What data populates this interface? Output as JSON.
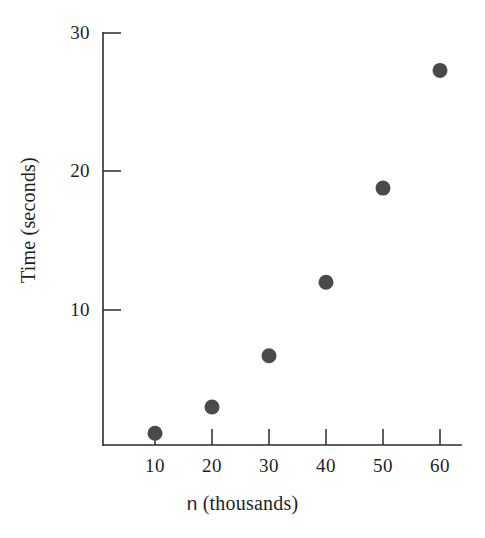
{
  "chart_data": {
    "type": "scatter",
    "title": "",
    "xlabel": "n (thousands)",
    "xlabel_variable": "n",
    "xlabel_rest": " (thousands)",
    "ylabel": "Time (seconds)",
    "x": [
      10,
      20,
      30,
      40,
      50,
      60
    ],
    "values": [
      1.1,
      3.0,
      6.7,
      12.0,
      18.8,
      27.3
    ],
    "points": [
      {
        "x": 10,
        "y": 1.1
      },
      {
        "x": 20,
        "y": 3.0
      },
      {
        "x": 30,
        "y": 6.7
      },
      {
        "x": 40,
        "y": 12.0
      },
      {
        "x": 50,
        "y": 18.8
      },
      {
        "x": 60,
        "y": 27.3
      }
    ],
    "xlim": [
      5,
      64
    ],
    "ylim": [
      0,
      30
    ],
    "xticks": [
      10,
      20,
      30,
      40,
      50,
      60
    ],
    "xtick_labels": [
      "10",
      "20",
      "30",
      "40",
      "50",
      "60"
    ],
    "yticks": [
      10,
      20,
      30
    ],
    "ytick_labels": [
      "10",
      "20",
      "30"
    ],
    "grid": false,
    "legend": false,
    "marker_color": "#4a4a4a",
    "marker_shape": "circle",
    "axis_color": "#2b2b2b",
    "background_color": "#ffffff"
  },
  "axis": {
    "y_tick_30": "30",
    "y_tick_20": "20",
    "y_tick_10": "10",
    "x_tick_10": "10",
    "x_tick_20": "20",
    "x_tick_30": "30",
    "x_tick_40": "40",
    "x_tick_50": "50",
    "x_tick_60": "60"
  },
  "labels": {
    "y_axis_title": "Time (seconds)",
    "x_axis_title_variable": "n",
    "x_axis_title_rest": " (thousands)"
  }
}
